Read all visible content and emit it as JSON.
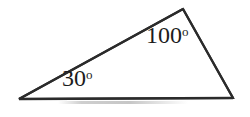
{
  "figure": {
    "kind": "triangle-angle-diagram",
    "background_color": "#ffffff",
    "stroke_color": "#2b2b2b",
    "stroke_width": 2.2,
    "text_color": "#1c1c1c",
    "canvas": {
      "width": 250,
      "height": 117
    }
  },
  "chart_data": {
    "type": "diagram",
    "title": "",
    "shape": "triangle",
    "vertices": [
      {
        "name": "left-vertex",
        "x": 19,
        "y": 99
      },
      {
        "name": "apex-vertex",
        "x": 183,
        "y": 9
      },
      {
        "name": "right-vertex",
        "x": 233,
        "y": 98
      }
    ],
    "edges": [
      {
        "name": "base-edge",
        "from": "left-vertex",
        "to": "right-vertex"
      },
      {
        "name": "upper-left-edge",
        "from": "left-vertex",
        "to": "apex-vertex"
      },
      {
        "name": "right-edge",
        "from": "apex-vertex",
        "to": "right-vertex"
      }
    ],
    "labels": [
      {
        "id": "angle-30",
        "value": 30,
        "unit": "degrees",
        "text": "30",
        "symbol": "o",
        "at_vertex": "left-vertex",
        "x": 62,
        "y": 66
      },
      {
        "id": "angle-100",
        "value": 100,
        "unit": "degrees",
        "text": "100",
        "symbol": "o",
        "at_vertex": "apex-vertex",
        "x": 146,
        "y": 23
      }
    ],
    "legend": null,
    "grid": false
  },
  "labels": {
    "angle_left": {
      "number": "30",
      "degree_symbol": "o"
    },
    "angle_apex": {
      "number": "100",
      "degree_symbol": "o"
    }
  }
}
